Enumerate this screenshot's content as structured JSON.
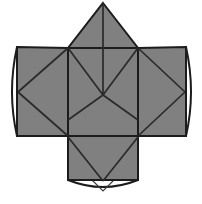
{
  "figure": {
    "title": "Unfolded polyhedron net diagram",
    "background_color": "#ffffff",
    "panel_fill_color": "#808080",
    "flap_fill_color": "#ffffff",
    "edge_color": "#1c1c1c",
    "crease_color": "#2a2a2a",
    "canvas": {
      "width": 202,
      "height": 204
    }
  },
  "chart_data": {
    "type": "diagram",
    "title": "Unfolded polyhedron net",
    "xlabel": "",
    "ylabel": "",
    "xlim": [
      0,
      202
    ],
    "ylim": [
      0,
      204
    ],
    "grid": false,
    "legend": "none",
    "vertices": {
      "apex_top": [
        103,
        3
      ],
      "square_top_left": [
        68,
        48
      ],
      "square_top_right": [
        138,
        48
      ],
      "square_bottom_left": [
        68,
        136
      ],
      "square_bottom_right": [
        138,
        136
      ],
      "center_cross": [
        103,
        95
      ],
      "left_wing_top_left": [
        17,
        47
      ],
      "left_wing_bottom_left": [
        17,
        136
      ],
      "right_wing_top_right": [
        186,
        47
      ],
      "right_wing_bottom_right": [
        186,
        136
      ],
      "bottom_panel_bottom_left": [
        68,
        180
      ],
      "bottom_panel_bottom_right": [
        138,
        180
      ],
      "left_flap_tip": [
        9,
        92
      ],
      "right_flap_tip": [
        194,
        92
      ],
      "bottom_flap_tip": [
        103,
        191
      ],
      "lower_left_diag_end": [
        68,
        120
      ],
      "lower_right_diag_end": [
        138,
        120
      ]
    },
    "shapes": [
      {
        "name": "top-gable-panel",
        "kind": "triangle",
        "points": [
          [
            103,
            3
          ],
          [
            138,
            48
          ],
          [
            68,
            48
          ]
        ],
        "fill": "#808080"
      },
      {
        "name": "left-wing-panel",
        "kind": "quad",
        "points": [
          [
            17,
            47
          ],
          [
            68,
            48
          ],
          [
            68,
            136
          ],
          [
            17,
            136
          ]
        ],
        "fill": "#808080"
      },
      {
        "name": "right-wing-panel",
        "kind": "quad",
        "points": [
          [
            138,
            48
          ],
          [
            186,
            47
          ],
          [
            186,
            136
          ],
          [
            138,
            136
          ]
        ],
        "fill": "#808080"
      },
      {
        "name": "center-square-panel",
        "kind": "quad",
        "points": [
          [
            68,
            48
          ],
          [
            138,
            48
          ],
          [
            138,
            136
          ],
          [
            68,
            136
          ]
        ],
        "fill": "#808080"
      },
      {
        "name": "bottom-panel",
        "kind": "quad",
        "points": [
          [
            68,
            136
          ],
          [
            138,
            136
          ],
          [
            138,
            180
          ],
          [
            68,
            180
          ]
        ],
        "fill": "#808080"
      },
      {
        "name": "left-glue-flap",
        "kind": "lens",
        "points": [
          [
            17,
            47
          ],
          [
            9,
            92
          ],
          [
            17,
            136
          ]
        ],
        "fill": "#ffffff"
      },
      {
        "name": "right-glue-flap",
        "kind": "lens",
        "points": [
          [
            186,
            47
          ],
          [
            194,
            92
          ],
          [
            186,
            136
          ]
        ],
        "fill": "#ffffff"
      },
      {
        "name": "bottom-glue-flap",
        "kind": "lens",
        "points": [
          [
            68,
            180
          ],
          [
            103,
            191
          ],
          [
            138,
            180
          ]
        ],
        "fill": "#ffffff"
      }
    ],
    "creases": [
      {
        "name": "vertical-centerline",
        "from": [
          103,
          3
        ],
        "to": [
          103,
          95
        ]
      },
      {
        "name": "v-crease-left",
        "from": [
          68,
          48
        ],
        "to": [
          103,
          95
        ]
      },
      {
        "name": "v-crease-right",
        "from": [
          138,
          48
        ],
        "to": [
          103,
          95
        ]
      },
      {
        "name": "diagonal-lower-left",
        "from": [
          103,
          95
        ],
        "to": [
          68,
          120
        ]
      },
      {
        "name": "diagonal-lower-right",
        "from": [
          103,
          95
        ],
        "to": [
          138,
          120
        ]
      },
      {
        "name": "left-wing-diagonal",
        "from": [
          17,
          92
        ],
        "to": [
          68,
          48
        ]
      },
      {
        "name": "left-wing-diagonal-lower",
        "from": [
          17,
          92
        ],
        "to": [
          68,
          136
        ]
      },
      {
        "name": "right-wing-diagonal",
        "from": [
          186,
          92
        ],
        "to": [
          138,
          48
        ]
      },
      {
        "name": "right-wing-diagonal-lower",
        "from": [
          186,
          92
        ],
        "to": [
          138,
          136
        ]
      },
      {
        "name": "bottom-panel-diagonal-left",
        "from": [
          68,
          136
        ],
        "to": [
          103,
          180
        ]
      },
      {
        "name": "bottom-panel-diagonal-right",
        "from": [
          138,
          136
        ],
        "to": [
          103,
          180
        ]
      }
    ],
    "flap_notches": [
      {
        "name": "left-notch",
        "points": [
          [
            17,
            84
          ],
          [
            29,
            92
          ],
          [
            17,
            100
          ]
        ]
      },
      {
        "name": "right-notch",
        "points": [
          [
            186,
            84
          ],
          [
            174,
            92
          ],
          [
            186,
            100
          ]
        ]
      },
      {
        "name": "bottom-notch",
        "points": [
          [
            94,
            180
          ],
          [
            103,
            190
          ],
          [
            112,
            180
          ]
        ]
      }
    ]
  }
}
